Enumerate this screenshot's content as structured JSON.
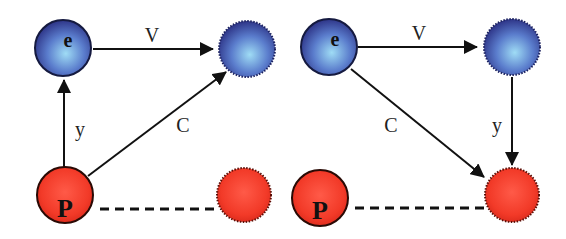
{
  "colors": {
    "blue_node": "#4a5aa8",
    "blue_highlight": "#8fd0f0",
    "red_node": "#f03020",
    "red_highlight": "#ff6a55",
    "edge": "#111111"
  },
  "left_panel": {
    "nodes": {
      "e": {
        "label": "e"
      },
      "p": {
        "label": "P"
      }
    },
    "edges": {
      "v": {
        "label": "V"
      },
      "y": {
        "label": "y"
      },
      "c": {
        "label": "C"
      }
    }
  },
  "right_panel": {
    "nodes": {
      "e": {
        "label": "e"
      },
      "p": {
        "label": "P"
      }
    },
    "edges": {
      "v": {
        "label": "V"
      },
      "y": {
        "label": "y"
      },
      "c": {
        "label": "C"
      }
    }
  }
}
